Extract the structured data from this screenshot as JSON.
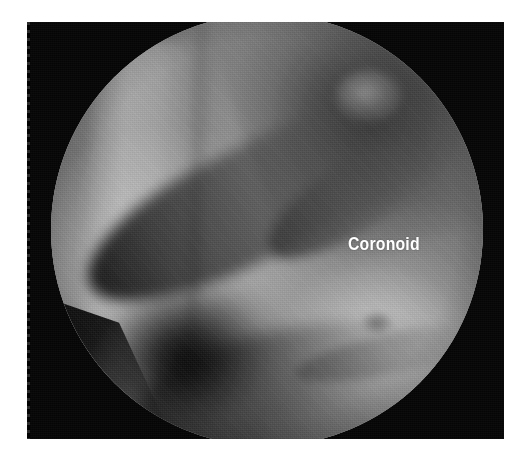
{
  "page": {
    "background_color": "#ffffff",
    "width": 522,
    "height": 462
  },
  "figure": {
    "name": "arthroscopic-view",
    "modality": "arthroscopy",
    "panel_background_color": "#050505",
    "view_shape": "circle",
    "labels": [
      {
        "id": "coronoid",
        "text": "Coronoid",
        "color": "#ffffff",
        "weight": "bold",
        "x": 348,
        "y": 238
      }
    ]
  },
  "chart_data": {
    "type": "image",
    "title": "",
    "annotations": [
      {
        "label": "Coronoid",
        "x": 348,
        "y": 238
      }
    ]
  }
}
